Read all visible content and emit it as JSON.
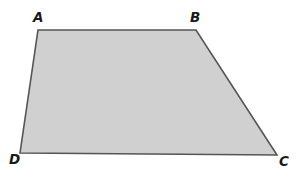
{
  "figure": {
    "kind": "geometry-diagram",
    "shape_name": "trapezoid",
    "background_color": "#ffffff",
    "fill_color": "#d0d0d0",
    "stroke_color": "#555555",
    "stroke_width": 1.6,
    "label_color": "#1a1a1a",
    "canvas": {
      "width": 300,
      "height": 173
    },
    "vertices": [
      {
        "id": "A",
        "label": "A",
        "x": 38,
        "y": 30,
        "label_x": 33,
        "label_y": 11
      },
      {
        "id": "B",
        "label": "B",
        "x": 196,
        "y": 30,
        "label_x": 190,
        "label_y": 11
      },
      {
        "id": "C",
        "label": "C",
        "x": 277,
        "y": 155,
        "label_x": 279,
        "label_y": 155
      },
      {
        "id": "D",
        "label": "D",
        "x": 20,
        "y": 153,
        "label_x": 9,
        "label_y": 153
      }
    ],
    "edges": [
      {
        "id": "AB",
        "from": "A",
        "to": "B"
      },
      {
        "id": "BC",
        "from": "B",
        "to": "C"
      },
      {
        "id": "CD",
        "from": "C",
        "to": "D"
      },
      {
        "id": "DA",
        "from": "D",
        "to": "A"
      }
    ],
    "polygon_points": "38,30 196,30 277,155 20,153"
  }
}
